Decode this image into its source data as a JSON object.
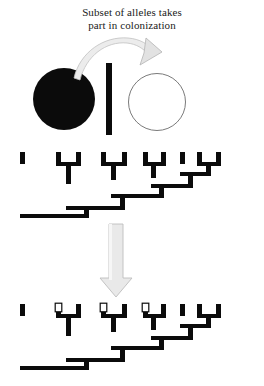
{
  "caption": {
    "line1": "Subset of alleles takes",
    "line2": "part in colonization"
  },
  "colors": {
    "ink": "#0b0b0b",
    "arrow_fill": "#e8e8e8",
    "arrow_stroke": "#b4b4b4",
    "circle_outline": "#7a7a7a",
    "marker_fill": "#ffffff",
    "background": "#ffffff"
  },
  "populations": {
    "source_label": "source-population",
    "barrier_label": "barrier",
    "colony_label": "new-colony",
    "source_filled": true,
    "colony_filled": false,
    "colonization_arrow": "curved-arrow-right"
  },
  "flow_arrow": {
    "direction": "down",
    "label": "transition-arrow"
  },
  "diagram_data": {
    "type": "diagram",
    "subject": "founder-effect-allele-subset",
    "tip_count": 10,
    "trees": [
      {
        "id": "tree-before",
        "label": "source-population-genealogy",
        "marked_tips": []
      },
      {
        "id": "tree-after",
        "label": "colonizing-subset-genealogy",
        "marked_tips": [
          2,
          4,
          6
        ]
      }
    ],
    "tip_x": [
      22,
      58,
      78,
      103,
      124,
      145,
      163,
      182,
      199,
      218
    ],
    "marker_shape": "hollow-square",
    "tree_style": "pectinate-ladder",
    "branch_width": 4
  }
}
